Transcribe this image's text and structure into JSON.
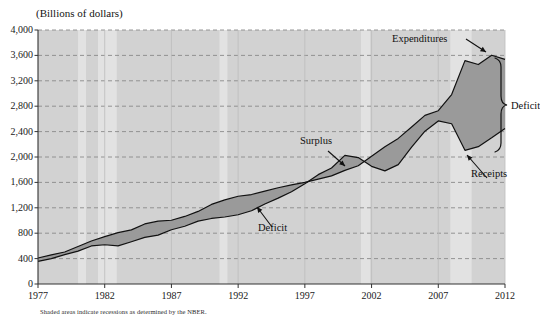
{
  "chart_data": {
    "type": "area",
    "title": "",
    "axis_title": "(Billions of dollars)",
    "xlabel": "",
    "ylabel": "Billions of dollars",
    "xlim": [
      1977,
      2012
    ],
    "ylim": [
      0,
      4000
    ],
    "grid": true,
    "legend_position": "inline-annotations",
    "ytick_labels": [
      "4,000",
      "3,600",
      "3,200",
      "2,800",
      "2,400",
      "2,000",
      "1,600",
      "1,200",
      "800",
      "400",
      "0"
    ],
    "ytick_values": [
      4000,
      3600,
      3200,
      2800,
      2400,
      2000,
      1600,
      1200,
      800,
      400,
      0
    ],
    "xtick_labels": [
      "1977",
      "1982",
      "1987",
      "1992",
      "1997",
      "2002",
      "2007",
      "2012"
    ],
    "xtick_values": [
      1977,
      1982,
      1987,
      1992,
      1997,
      2002,
      2007,
      2012
    ],
    "footnote": "Shaded areas indicate recessions as determined by the NBER.",
    "annotations": [
      {
        "label": "Expenditures",
        "x": 2007.2,
        "y": 3780
      },
      {
        "label": "Deficit",
        "x": 1993.1,
        "y": 1020
      },
      {
        "label": "Surplus",
        "x": 1998.6,
        "y": 2320
      },
      {
        "label": "Deficit",
        "x": 2012.4,
        "y": 2620
      },
      {
        "label": "Receipts",
        "x": 2011.2,
        "y": 1760
      }
    ],
    "recessions": [
      {
        "start": 1980.0,
        "end": 1980.6
      },
      {
        "start": 1981.5,
        "end": 1982.9
      },
      {
        "start": 1990.6,
        "end": 1991.2
      },
      {
        "start": 2001.2,
        "end": 2001.9
      },
      {
        "start": 2007.9,
        "end": 2009.5
      }
    ],
    "series": [
      {
        "name": "Expenditures",
        "x": [
          1977,
          1978,
          1979,
          1980,
          1981,
          1982,
          1983,
          1984,
          1985,
          1986,
          1987,
          1988,
          1989,
          1990,
          1991,
          1992,
          1993,
          1994,
          1995,
          1996,
          1997,
          1998,
          1999,
          2000,
          2001,
          2002,
          2003,
          2004,
          2005,
          2006,
          2007,
          2008,
          2009,
          2010,
          2011,
          2012
        ],
        "values": [
          409,
          459,
          504,
          591,
          678,
          746,
          808,
          852,
          946,
          990,
          1004,
          1064,
          1143,
          1253,
          1324,
          1382,
          1409,
          1462,
          1516,
          1560,
          1601,
          1652,
          1702,
          1789,
          1863,
          2011,
          2160,
          2293,
          2472,
          2655,
          2729,
          2983,
          3518,
          3456,
          3603,
          3538
        ]
      },
      {
        "name": "Receipts",
        "x": [
          1977,
          1978,
          1979,
          1980,
          1981,
          1982,
          1983,
          1984,
          1985,
          1986,
          1987,
          1988,
          1989,
          1990,
          1991,
          1992,
          1993,
          1994,
          1995,
          1996,
          1997,
          1998,
          1999,
          2000,
          2001,
          2002,
          2003,
          2004,
          2005,
          2006,
          2007,
          2008,
          2009,
          2010,
          2011,
          2012
        ],
        "values": [
          356,
          400,
          463,
          517,
          599,
          618,
          601,
          666,
          734,
          769,
          854,
          909,
          991,
          1032,
          1055,
          1091,
          1154,
          1259,
          1352,
          1453,
          1579,
          1722,
          1827,
          2025,
          1991,
          1853,
          1782,
          1880,
          2154,
          2407,
          2568,
          2524,
          2105,
          2163,
          2303,
          2450
        ]
      }
    ]
  },
  "layout": {
    "plot_left": 38,
    "plot_right": 505,
    "plot_top": 30,
    "plot_bottom": 284
  }
}
